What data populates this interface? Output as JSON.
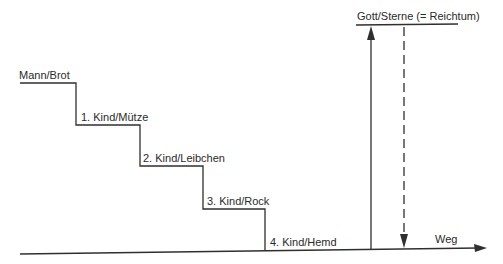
{
  "diagram": {
    "steps": [
      {
        "label": "Mann/Brot"
      },
      {
        "label": "1. Kind/Mütze"
      },
      {
        "label": "2. Kind/Leibchen"
      },
      {
        "label": "3. Kind/Rock"
      },
      {
        "label": "4. Kind/Hemd"
      }
    ],
    "top_label": "Gott/Sterne (= Reichtum)",
    "axis_label": "Weg",
    "colors": {
      "line": "#2f2f2f",
      "text": "#2a2a2a",
      "background": "#ffffff"
    }
  }
}
